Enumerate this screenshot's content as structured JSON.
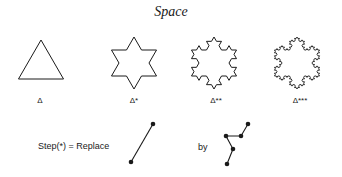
{
  "title": "Space",
  "colors": {
    "stroke": "#1a1a1a",
    "background": "#ffffff"
  },
  "figures": [
    {
      "id": "delta",
      "label": "Δ",
      "iterations": 0,
      "cx": 41,
      "cy": 66,
      "r": 26,
      "label_x": 40,
      "kind": "triangle"
    },
    {
      "id": "delta1",
      "label": "Δ*",
      "iterations": 1,
      "cx": 134,
      "cy": 63,
      "r": 26,
      "label_x": 134,
      "kind": "koch"
    },
    {
      "id": "delta2",
      "label": "Δ**",
      "iterations": 2,
      "cx": 214,
      "cy": 63,
      "r": 26,
      "label_x": 216,
      "kind": "koch"
    },
    {
      "id": "delta3",
      "label": "Δ***",
      "iterations": 3,
      "cx": 297,
      "cy": 63,
      "r": 26,
      "label_x": 300,
      "kind": "koch"
    }
  ],
  "labels_y": 96,
  "rule": {
    "step_text": "Step(*) = Replace",
    "step_x": 38,
    "step_y": 141,
    "by_text": "by",
    "by_x": 198,
    "by_y": 142,
    "segment": [
      [
        131,
        162
      ],
      [
        153,
        124
      ]
    ],
    "replacement": [
      [
        227,
        164
      ],
      [
        233,
        149
      ],
      [
        226,
        136
      ],
      [
        241,
        136
      ],
      [
        248,
        124
      ]
    ]
  }
}
